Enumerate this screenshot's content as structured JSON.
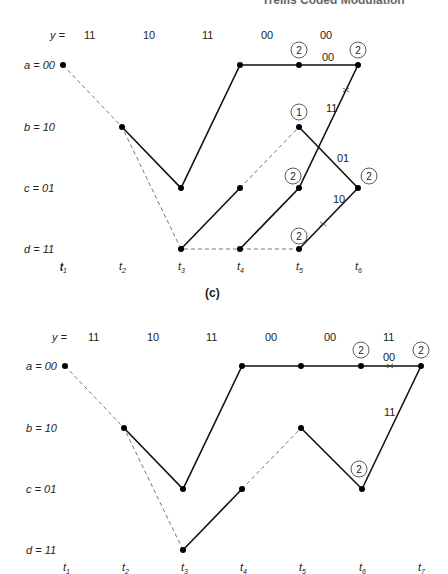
{
  "page_header": {
    "running_title": "Trellis Coded Modulation"
  },
  "diagram_c": {
    "caption": "(c)",
    "received_label": "y =",
    "received": [
      "11",
      "10",
      "11",
      "00",
      "00"
    ],
    "states": [
      {
        "name": "a",
        "value": "00",
        "label": "a = 00"
      },
      {
        "name": "b",
        "value": "10",
        "label": "b = 10"
      },
      {
        "name": "c",
        "value": "01",
        "label": "c = 01"
      },
      {
        "name": "d",
        "value": "11",
        "label": "d = 11"
      }
    ],
    "times": [
      "t1",
      "t2",
      "t3",
      "t4",
      "t5",
      "t6"
    ],
    "metrics": [
      {
        "at": "a,t5",
        "value": "2"
      },
      {
        "at": "a,t6",
        "value": "2"
      },
      {
        "at": "b,t5",
        "value": "1"
      },
      {
        "at": "c,t5",
        "value": "2"
      },
      {
        "at": "c,t6",
        "value": "2"
      },
      {
        "at": "d,t5",
        "value": "2"
      }
    ],
    "branch_labels": [
      {
        "text": "00",
        "on": "a,t5->a,t6"
      },
      {
        "text": "11",
        "on": "c,t5->a,t6"
      },
      {
        "text": "01",
        "on": "b,t5->c,t6"
      },
      {
        "text": "10",
        "on": "d,t5->c,t6"
      }
    ]
  },
  "diagram_d": {
    "received_label": "y =",
    "received": [
      "11",
      "10",
      "11",
      "00",
      "00",
      "11"
    ],
    "states": [
      {
        "name": "a",
        "value": "00",
        "label": "a = 00"
      },
      {
        "name": "b",
        "value": "10",
        "label": "b = 10"
      },
      {
        "name": "c",
        "value": "01",
        "label": "c = 01"
      },
      {
        "name": "d",
        "value": "11",
        "label": "d = 11"
      }
    ],
    "times": [
      "t1",
      "t2",
      "t3",
      "t4",
      "t5",
      "t6",
      "t7"
    ],
    "metrics": [
      {
        "at": "a,t6",
        "value": "2"
      },
      {
        "at": "a,t7",
        "value": "2"
      },
      {
        "at": "c,t6",
        "value": "2"
      }
    ],
    "branch_labels": [
      {
        "text": "00",
        "on": "a,t6->a,t7"
      },
      {
        "text": "11",
        "on": "c,t6->a,t7"
      }
    ]
  }
}
